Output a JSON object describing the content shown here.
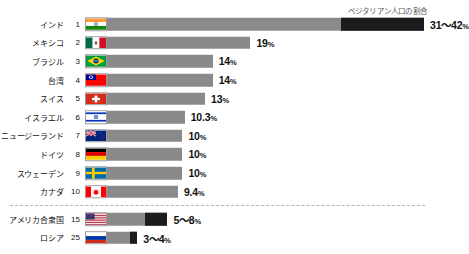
{
  "chart_data": {
    "type": "bar",
    "title": "",
    "legend_caption": "ベジタリアン人口の割合",
    "xlabel": "",
    "ylabel": "",
    "unit": "%",
    "xlim": [
      0,
      42
    ],
    "grid": false,
    "legend_position": "top-right",
    "categories": [
      "インド",
      "メキシコ",
      "ブラジル",
      "台湾",
      "スイス",
      "イスラエル",
      "ニュージーランド",
      "ドイツ",
      "スウェーデン",
      "カナダ",
      "アメリカ合衆国",
      "ロシア"
    ],
    "values": [
      42,
      19,
      14,
      14,
      13,
      10.3,
      10,
      10,
      10,
      9.4,
      8,
      4
    ],
    "rows": [
      {
        "country": "インド",
        "rank": "1",
        "value_label": "31〜42",
        "pct_suffix": "%",
        "bar_value": 42,
        "range_low": 31,
        "range_high": 42,
        "flag": "flag-india"
      },
      {
        "country": "メキシコ",
        "rank": "2",
        "value_label": "19",
        "pct_suffix": "%",
        "bar_value": 19,
        "range_low": null,
        "range_high": null,
        "flag": "flag-mexico"
      },
      {
        "country": "ブラジル",
        "rank": "3",
        "value_label": "14",
        "pct_suffix": "%",
        "bar_value": 14,
        "range_low": null,
        "range_high": null,
        "flag": "flag-brazil"
      },
      {
        "country": "台湾",
        "rank": "4",
        "value_label": "14",
        "pct_suffix": "%",
        "bar_value": 14,
        "range_low": null,
        "range_high": null,
        "flag": "flag-taiwan"
      },
      {
        "country": "スイス",
        "rank": "5",
        "value_label": "13",
        "pct_suffix": "%",
        "bar_value": 13,
        "range_low": null,
        "range_high": null,
        "flag": "flag-switzerland"
      },
      {
        "country": "イスラエル",
        "rank": "6",
        "value_label": "10.3",
        "pct_suffix": "%",
        "bar_value": 10.3,
        "range_low": null,
        "range_high": null,
        "flag": "flag-israel"
      },
      {
        "country": "ニュージーランド",
        "rank": "7",
        "value_label": "10",
        "pct_suffix": "%",
        "bar_value": 10,
        "range_low": null,
        "range_high": null,
        "flag": "flag-new-zealand"
      },
      {
        "country": "ドイツ",
        "rank": "8",
        "value_label": "10",
        "pct_suffix": "%",
        "bar_value": 10,
        "range_low": null,
        "range_high": null,
        "flag": "flag-germany"
      },
      {
        "country": "スウェーデン",
        "rank": "9",
        "value_label": "10",
        "pct_suffix": "%",
        "bar_value": 10,
        "range_low": null,
        "range_high": null,
        "flag": "flag-sweden"
      },
      {
        "country": "カナダ",
        "rank": "10",
        "value_label": "9.4",
        "pct_suffix": "%",
        "bar_value": 9.4,
        "range_low": null,
        "range_high": null,
        "flag": "flag-canada"
      },
      {
        "country": "アメリカ合衆国",
        "rank": "15",
        "value_label": "5〜8",
        "pct_suffix": "%",
        "bar_value": 8,
        "range_low": 5,
        "range_high": 8,
        "flag": "flag-usa"
      },
      {
        "country": "ロシア",
        "rank": "25",
        "value_label": "3〜4",
        "pct_suffix": "%",
        "bar_value": 4,
        "range_low": 3,
        "range_high": 4,
        "flag": "flag-russia"
      }
    ],
    "divider_after_index": 9
  },
  "colors": {
    "bar": "#8a8a8a",
    "bar_highlight": "#1c1c1c",
    "background": "#ffffff",
    "text": "#111111",
    "caption": "#5a5a5a",
    "divider": "#b4b4b4"
  }
}
